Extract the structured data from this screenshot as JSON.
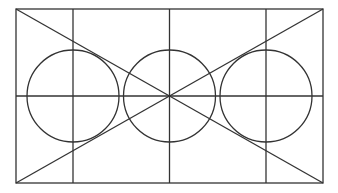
{
  "diagram": {
    "title": "",
    "stroke_color": "#333333",
    "background": "#ffffff",
    "stroke_width": 1.3,
    "rectangle": {
      "x1": 16,
      "y1": 9,
      "x2": 323,
      "y2": 183
    },
    "horizontal_line": {
      "y": 96
    },
    "vertical_lines": [
      73,
      169.5,
      266
    ],
    "diagonals": [
      {
        "x1": 16,
        "y1": 9,
        "x2": 323,
        "y2": 183
      },
      {
        "x1": 323,
        "y1": 9,
        "x2": 16,
        "y2": 183
      }
    ],
    "circles": [
      {
        "cx": 73,
        "cy": 96,
        "r": 46
      },
      {
        "cx": 169.5,
        "cy": 96,
        "r": 46
      },
      {
        "cx": 266,
        "cy": 96,
        "r": 46
      }
    ]
  }
}
